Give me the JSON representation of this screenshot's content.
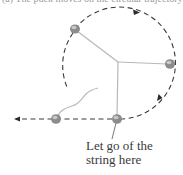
{
  "figure": {
    "caption_partial": "(a) The puck moves on the circular trajectory",
    "label": {
      "line1": "Let go of the",
      "line2": "string here"
    },
    "colors": {
      "dash": "#3a3a3a",
      "string": "#b8b8b8",
      "puck": "#8c8c8c",
      "puck_highlight": "#c8c8c8",
      "text": "#3a3a3a"
    },
    "pivot": {
      "x": 118,
      "y": 62
    },
    "pucks": [
      {
        "name": "puck-top-left",
        "x": 75,
        "y": 29
      },
      {
        "name": "puck-right",
        "x": 170,
        "y": 64
      },
      {
        "name": "puck-bottom",
        "x": 117,
        "y": 119
      },
      {
        "name": "puck-released",
        "x": 56,
        "y": 119
      }
    ],
    "arrows": [
      {
        "name": "arrow-top",
        "direction": "right"
      },
      {
        "name": "arrow-lower-right",
        "direction": "down-left"
      },
      {
        "name": "arrow-left",
        "direction": "left"
      }
    ]
  }
}
